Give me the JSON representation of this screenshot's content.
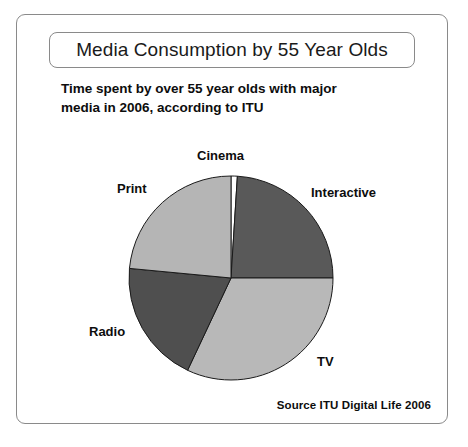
{
  "figure": {
    "title": "Media Consumption by 55 Year Olds",
    "subtitle_line1": "Time spent by over 55 year olds with major",
    "subtitle_line2": "media in 2006, according to ITU",
    "source": "Source ITU Digital Life 2006"
  },
  "chart_data": {
    "type": "pie",
    "title": "Media Consumption by 55 Year Olds",
    "subtitle": "Time spent by over 55 year olds with major media in 2006, according to ITU",
    "source": "Source ITU Digital Life 2006",
    "categories": [
      "Cinema",
      "Interactive",
      "TV",
      "Radio",
      "Print"
    ],
    "values": [
      1,
      24,
      32,
      19.5,
      23.5
    ],
    "unit": "percent of time spent",
    "start_angle_deg": 0,
    "direction": "clockwise",
    "labels_position": "outside",
    "legend": "none",
    "slices": [
      {
        "label": "Cinema",
        "value": 1,
        "color": "#ffffff",
        "start_deg": 0,
        "end_deg": 3.6
      },
      {
        "label": "Interactive",
        "value": 24,
        "color": "#595959",
        "start_deg": 3.6,
        "end_deg": 90.0
      },
      {
        "label": "TV",
        "value": 32,
        "color": "#b8b8b8",
        "start_deg": 90.0,
        "end_deg": 205.2
      },
      {
        "label": "Radio",
        "value": 19.5,
        "color": "#4f4f4f",
        "start_deg": 205.2,
        "end_deg": 275.4
      },
      {
        "label": "Print",
        "value": 23.5,
        "color": "#b5b5b5",
        "start_deg": 275.4,
        "end_deg": 360.0
      }
    ],
    "geometry": {
      "center_x": 214,
      "center_y": 263,
      "radius": 102
    },
    "colors": {
      "cinema": "#ffffff",
      "interactive": "#595959",
      "tv": "#b8b8b8",
      "radio": "#4f4f4f",
      "print": "#b5b5b5",
      "outline": "#1a1a1a",
      "frame": "#8a8a8a"
    }
  }
}
